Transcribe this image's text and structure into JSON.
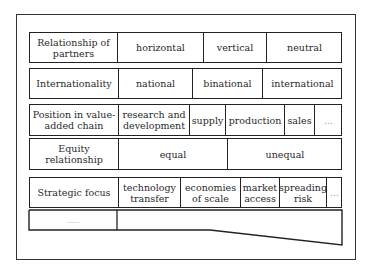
{
  "diagram": {
    "rows": [
      {
        "label": "Relationship of partners",
        "options": [
          "horizontal",
          "vertical",
          "neutral"
        ]
      },
      {
        "label": "Internationality",
        "options": [
          "national",
          "binational",
          "international"
        ]
      },
      {
        "label": "Position in value-added chain",
        "options": [
          "research and development",
          "supply",
          "production",
          "sales",
          "..."
        ]
      },
      {
        "label": "Equity relationship",
        "options": [
          "equal",
          "unequal"
        ]
      },
      {
        "label": "Strategic focus",
        "options": [
          "technology transfer",
          "economies of scale",
          "market access",
          "spreading risk",
          "..."
        ]
      },
      {
        "label": ".....",
        "options": []
      }
    ]
  }
}
